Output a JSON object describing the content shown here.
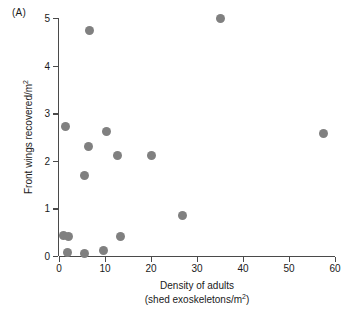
{
  "panel": {
    "label": "(A)"
  },
  "axes": {
    "x": {
      "title_line1": "Density of adults",
      "title_line2_prefix": "(shed exoskeletons/m",
      "title_line2_sup": "2",
      "title_line2_suffix": ")",
      "ticks": [
        "0",
        "10",
        "20",
        "30",
        "40",
        "50",
        "60"
      ],
      "min": 0,
      "max": 60
    },
    "y": {
      "title_prefix": "Front wings recovered/m",
      "title_sup": "2",
      "ticks": [
        "0",
        "1",
        "2",
        "3",
        "4",
        "5"
      ],
      "min": 0,
      "max": 5
    }
  },
  "style": {
    "marker_color": "#808080",
    "axis_color": "#4a4a4a",
    "text_color": "#1a1a1a",
    "background": "#ffffff"
  },
  "chart_data": {
    "type": "scatter",
    "title": "(A)",
    "xlabel": "Density of adults (shed exoskeletons/m2)",
    "ylabel": "Front wings recovered/m2",
    "xlim": [
      0,
      60
    ],
    "ylim": [
      0,
      5
    ],
    "xticks": [
      0,
      10,
      20,
      30,
      40,
      50,
      60
    ],
    "yticks": [
      0,
      1,
      2,
      3,
      4,
      5
    ],
    "grid": false,
    "legend": "none",
    "series": [
      {
        "name": "sites",
        "marker": "filled-circle",
        "color": "#808080",
        "points": [
          {
            "x": 0.9,
            "y": 0.43
          },
          {
            "x": 2.0,
            "y": 0.41
          },
          {
            "x": 1.9,
            "y": 0.08
          },
          {
            "x": 5.6,
            "y": 0.05
          },
          {
            "x": 9.6,
            "y": 0.11
          },
          {
            "x": 13.4,
            "y": 0.41
          },
          {
            "x": 1.5,
            "y": 2.73
          },
          {
            "x": 5.6,
            "y": 1.7
          },
          {
            "x": 6.4,
            "y": 2.31
          },
          {
            "x": 10.4,
            "y": 2.61
          },
          {
            "x": 12.8,
            "y": 2.11
          },
          {
            "x": 20.1,
            "y": 2.11
          },
          {
            "x": 26.9,
            "y": 0.85
          },
          {
            "x": 6.6,
            "y": 4.73
          },
          {
            "x": 35.0,
            "y": 5.0
          },
          {
            "x": 57.5,
            "y": 2.57
          }
        ]
      }
    ]
  }
}
